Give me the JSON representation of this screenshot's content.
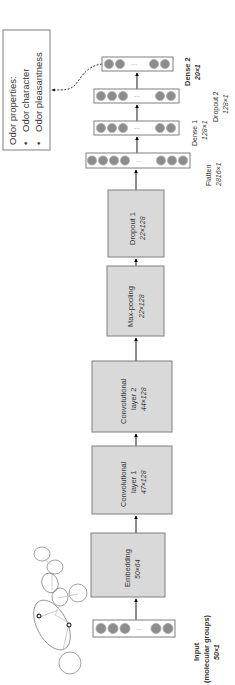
{
  "output_box": {
    "title": "Odor properties:",
    "items": [
      "Odor character",
      "Odor pleasantness"
    ]
  },
  "layers": {
    "input": {
      "name": "Input",
      "sub": "(molecular groups)",
      "dim": "50×1"
    },
    "embedding": {
      "name": "Embedding",
      "dim": "50×64"
    },
    "conv1": {
      "name": "Convolutional",
      "name2": "layer 1",
      "dim": "47×128"
    },
    "conv2": {
      "name": "Convolutional",
      "name2": "layer 2",
      "dim": "44×128"
    },
    "maxpool": {
      "name": "Max-pooling",
      "dim": "22×128"
    },
    "dropout1": {
      "name": "Dropout 1",
      "dim": "22×128"
    },
    "flatten": {
      "name": "Flatten",
      "dim": "2816×1"
    },
    "dense1": {
      "name": "Dense 1",
      "dim": "128×1"
    },
    "dropout2": {
      "name": "Dropout 2",
      "dim": "128×1"
    },
    "dense2": {
      "name": "Dense 2",
      "dim": "20×1"
    }
  },
  "ellipsis": "···",
  "colors": {
    "layer_fill": "#d9d9d9",
    "layer_stroke": "#7f7f7f",
    "node_fill": "#8c8c8c"
  }
}
